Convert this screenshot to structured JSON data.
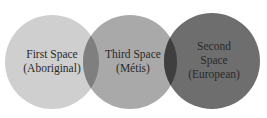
{
  "diagram": {
    "type": "venn",
    "circles": [
      {
        "id": "first",
        "lines": [
          "First Space",
          "(Aboriginal)"
        ],
        "color": "#cfcfcf"
      },
      {
        "id": "third",
        "lines": [
          "Third Space",
          "(Métis)"
        ],
        "color": "#a9a9a9"
      },
      {
        "id": "second",
        "lines": [
          "Second",
          "Space",
          "(European)"
        ],
        "color": "#6e6e6e"
      }
    ],
    "overlap_colors": {
      "first_third": "#7f7f7f",
      "third_second": "#3f3f3f"
    }
  }
}
